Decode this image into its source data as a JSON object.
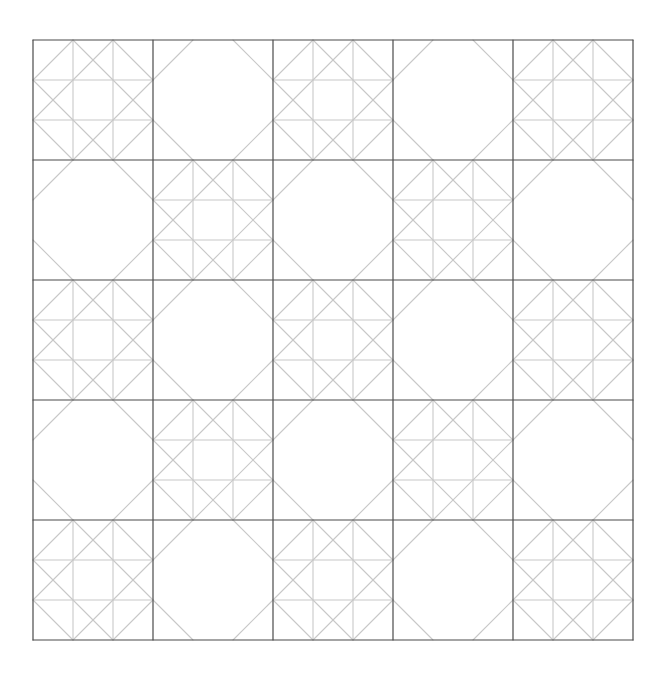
{
  "diagram": {
    "type": "quilt-block-pattern",
    "grid": {
      "rows": 5,
      "cols": 5
    },
    "origin": {
      "x": 33,
      "y": 40
    },
    "block_size": 120,
    "colors": {
      "background": "#ffffff",
      "block_border": "#4a4a4a",
      "pattern_line": "#c8c8c8"
    },
    "block_types": {
      "star": "Nine-patch star with corner cuts and crossing diagonals",
      "octagon": "Plain block with four corner triangle cuts"
    },
    "layout": [
      [
        "star",
        "octagon",
        "star",
        "octagon",
        "star"
      ],
      [
        "octagon",
        "star",
        "octagon",
        "star",
        "octagon"
      ],
      [
        "star",
        "octagon",
        "star",
        "octagon",
        "star"
      ],
      [
        "octagon",
        "star",
        "octagon",
        "star",
        "octagon"
      ],
      [
        "star",
        "octagon",
        "star",
        "octagon",
        "star"
      ]
    ]
  }
}
